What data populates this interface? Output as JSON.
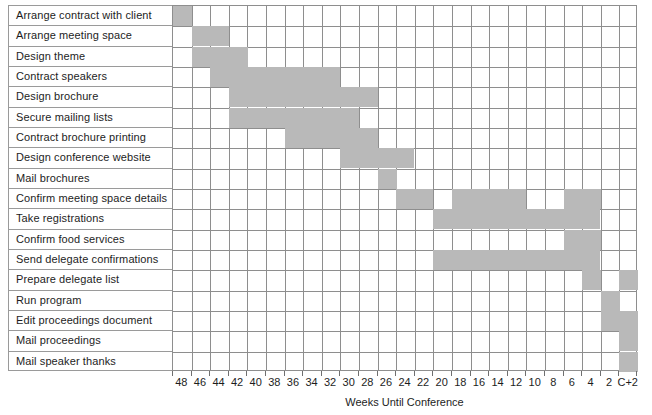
{
  "chart_data": {
    "type": "bar",
    "title": "",
    "subtitle": "",
    "xlabel": "Weeks Until Conference",
    "ylabel": "",
    "orientation": "horizontal",
    "chart_subtype": "gantt",
    "grid": true,
    "legend": null,
    "bar_color": "#b9b9b9",
    "grid_color": "#8e8e8e",
    "text_color": "#1d1d1d",
    "column_count": 25,
    "x_tick_labels": [
      "48",
      "46",
      "44",
      "42",
      "40",
      "38",
      "36",
      "34",
      "32",
      "30",
      "28",
      "26",
      "24",
      "22",
      "20",
      "18",
      "16",
      "14",
      "12",
      "10",
      "8",
      "6",
      "4",
      "2",
      "C+2"
    ],
    "categories": [
      "Arrange contract with client",
      "Arrange meeting space",
      "Design theme",
      "Contract speakers",
      "Design brochure",
      "Secure mailing lists",
      "Contract brochure printing",
      "Design conference website",
      "Mail brochures",
      "Confirm meeting space details",
      "Take registrations",
      "Confirm food services",
      "Send delegate confirmations",
      "Prepare delegate list",
      "Run program",
      "Edit proceedings document",
      "Mail proceedings",
      "Mail speaker thanks"
    ],
    "tasks": [
      {
        "name": "Arrange contract with client",
        "spans": [
          [
            1,
            1
          ]
        ],
        "start_week": 48,
        "end_week": 48
      },
      {
        "name": "Arrange meeting space",
        "spans": [
          [
            2,
            3
          ]
        ],
        "start_week": 46,
        "end_week": 44
      },
      {
        "name": "Design theme",
        "spans": [
          [
            2,
            4
          ]
        ],
        "start_week": 46,
        "end_week": 42
      },
      {
        "name": "Contract speakers",
        "spans": [
          [
            3,
            9
          ]
        ],
        "start_week": 44,
        "end_week": 32
      },
      {
        "name": "Design brochure",
        "spans": [
          [
            4,
            11
          ]
        ],
        "start_week": 42,
        "end_week": 28
      },
      {
        "name": "Secure mailing lists",
        "spans": [
          [
            4,
            10
          ]
        ],
        "start_week": 42,
        "end_week": 30
      },
      {
        "name": "Contract brochure printing",
        "spans": [
          [
            7,
            11
          ]
        ],
        "start_week": 36,
        "end_week": 28
      },
      {
        "name": "Design conference website",
        "spans": [
          [
            10,
            13
          ]
        ],
        "start_week": 30,
        "end_week": 24
      },
      {
        "name": "Mail brochures",
        "spans": [
          [
            12,
            12
          ]
        ],
        "start_week": 26,
        "end_week": 26
      },
      {
        "name": "Confirm meeting space details",
        "spans": [
          [
            13,
            14
          ],
          [
            16,
            19
          ],
          [
            22,
            23
          ]
        ],
        "start_week": 24,
        "end_week": 4
      },
      {
        "name": "Take registrations",
        "spans": [
          [
            15,
            23
          ]
        ],
        "start_week": 20,
        "end_week": 4
      },
      {
        "name": "Confirm food services",
        "spans": [
          [
            22,
            23
          ]
        ],
        "start_week": 6,
        "end_week": 4
      },
      {
        "name": "Send delegate confirmations",
        "spans": [
          [
            15,
            23
          ]
        ],
        "start_week": 20,
        "end_week": 4
      },
      {
        "name": "Prepare delegate list",
        "spans": [
          [
            23,
            23
          ],
          [
            25,
            25
          ]
        ],
        "start_week": 4,
        "end_week": 0
      },
      {
        "name": "Run program",
        "spans": [
          [
            24,
            24
          ]
        ],
        "start_week": 2,
        "end_week": 2
      },
      {
        "name": "Edit proceedings document",
        "spans": [
          [
            24,
            25
          ]
        ],
        "start_week": 2,
        "end_week": 0
      },
      {
        "name": "Mail proceedings",
        "spans": [
          [
            25,
            25
          ]
        ],
        "start_week": 0,
        "end_week": 0
      },
      {
        "name": "Mail speaker thanks",
        "spans": [
          [
            25,
            25
          ]
        ],
        "start_week": 0,
        "end_week": 0
      }
    ]
  }
}
